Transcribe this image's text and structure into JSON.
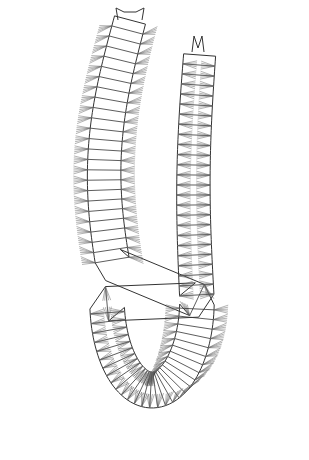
{
  "figure": {
    "style": "black ink line drawing on white",
    "colors": {
      "background": "#ffffff",
      "ink": "#333333",
      "chaetae": "#666666"
    },
    "left_arm": {
      "has_head": true,
      "head_features": [
        "palps",
        "tentacular cirri"
      ]
    },
    "right_arm": {
      "has_head": true,
      "head_features": [
        "paired antennae"
      ]
    },
    "visible_text": ""
  }
}
